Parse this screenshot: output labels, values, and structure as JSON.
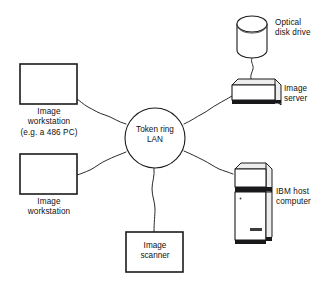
{
  "diagram": {
    "background": "#ffffff",
    "ink": "#1b1b1b",
    "hub": {
      "label": "Token ring\nLAN",
      "shape": "circle"
    },
    "nodes": [
      {
        "id": "image-workstation-486",
        "label": "Image\nworkstation\n(e.g. a 486 PC)",
        "shape": "rectangle",
        "position": "upper-left"
      },
      {
        "id": "image-workstation",
        "label": "Image\nworkstation",
        "shape": "rectangle",
        "position": "lower-left"
      },
      {
        "id": "image-scanner",
        "label": "Image\nscanner",
        "shape": "rectangle-with-inner-label",
        "position": "bottom-center"
      },
      {
        "id": "optical-disk-drive",
        "label": "Optical\ndisk drive",
        "shape": "cylinder",
        "position": "top-right"
      },
      {
        "id": "image-server",
        "label": "Image\nserver",
        "shape": "desktop-unit",
        "position": "right-upper"
      },
      {
        "id": "ibm-host-computer",
        "label": "IBM host\ncomputer",
        "shape": "tower-unit",
        "position": "right-lower"
      }
    ],
    "connections": [
      {
        "from": "hub",
        "to": "image-workstation-486",
        "style": "wavy"
      },
      {
        "from": "hub",
        "to": "image-workstation",
        "style": "wavy"
      },
      {
        "from": "hub",
        "to": "image-scanner",
        "style": "wavy"
      },
      {
        "from": "hub",
        "to": "image-server",
        "style": "wavy"
      },
      {
        "from": "hub",
        "to": "ibm-host-computer",
        "style": "wavy"
      },
      {
        "from": "image-server",
        "to": "optical-disk-drive",
        "style": "wavy"
      }
    ]
  }
}
